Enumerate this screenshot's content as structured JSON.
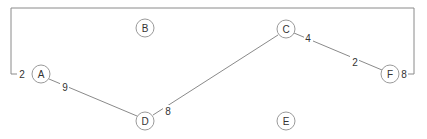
{
  "graph": {
    "nodes": [
      {
        "id": "A",
        "label": "A",
        "x": 41,
        "y": 74
      },
      {
        "id": "B",
        "label": "B",
        "x": 145,
        "y": 28
      },
      {
        "id": "C",
        "label": "C",
        "x": 286,
        "y": 29
      },
      {
        "id": "D",
        "label": "D",
        "x": 145,
        "y": 121
      },
      {
        "id": "E",
        "label": "E",
        "x": 286,
        "y": 121
      },
      {
        "id": "F",
        "label": "F",
        "x": 390,
        "y": 74
      }
    ],
    "edges": [
      {
        "from": "A",
        "to": "D",
        "weight_from": "9",
        "weight_to": ""
      },
      {
        "from": "D",
        "to": "C",
        "weight_from": "8",
        "weight_to": ""
      },
      {
        "from": "C",
        "to": "F",
        "weight_from": "4",
        "weight_to": "2"
      },
      {
        "from": "A",
        "to": "F",
        "routed": "top-bracket",
        "weight_from": "2",
        "weight_to": "8"
      }
    ]
  },
  "labels": {
    "A": "A",
    "B": "B",
    "C": "C",
    "D": "D",
    "E": "E",
    "F": "F",
    "w_AD_A": "9",
    "w_DC_D": "8",
    "w_CF_C": "4",
    "w_CF_F": "2",
    "w_AF_A": "2",
    "w_AF_F": "8"
  }
}
